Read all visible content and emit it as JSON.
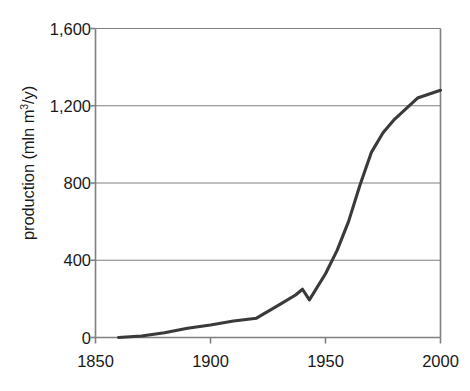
{
  "chart_data": {
    "type": "line",
    "title": "",
    "xlabel": "",
    "ylabel": "production (mln m3/y)",
    "ylabel_html": "production (mln m<sup>3</sup>/y)",
    "xlim": [
      1850,
      2000
    ],
    "ylim": [
      0,
      1600
    ],
    "grid": "horizontal",
    "legend": "none",
    "line_color": "#3a3a3a",
    "axis_color": "#808080",
    "gridline_color": "#808080",
    "x_ticks": [
      1850,
      1900,
      1950,
      2000
    ],
    "x_tick_labels": [
      "1850",
      "1900",
      "1950",
      "2000"
    ],
    "y_ticks": [
      0,
      400,
      800,
      1200,
      1600
    ],
    "y_tick_labels": [
      "0",
      "400",
      "800",
      "1,200",
      "1,600"
    ],
    "series": [
      {
        "name": "production",
        "points": [
          [
            1860,
            0
          ],
          [
            1870,
            8
          ],
          [
            1880,
            25
          ],
          [
            1890,
            48
          ],
          [
            1900,
            65
          ],
          [
            1910,
            85
          ],
          [
            1920,
            100
          ],
          [
            1930,
            170
          ],
          [
            1937,
            220
          ],
          [
            1940,
            250
          ],
          [
            1943,
            195
          ],
          [
            1950,
            330
          ],
          [
            1955,
            450
          ],
          [
            1960,
            600
          ],
          [
            1965,
            790
          ],
          [
            1970,
            960
          ],
          [
            1975,
            1060
          ],
          [
            1980,
            1130
          ],
          [
            1990,
            1240
          ],
          [
            2000,
            1280
          ]
        ]
      }
    ]
  },
  "axis": {
    "y_title_text": "production (mln m",
    "y_title_sup": "3",
    "y_title_tail": "/y)"
  }
}
